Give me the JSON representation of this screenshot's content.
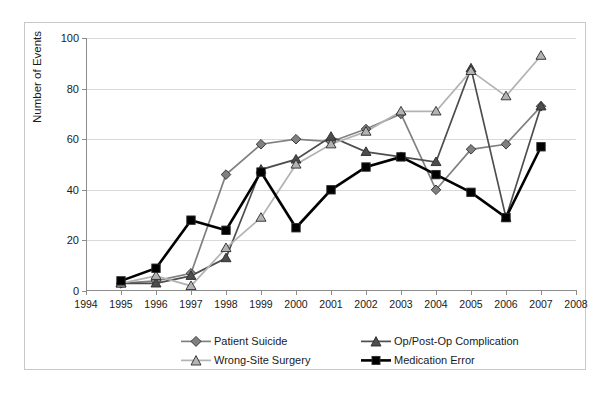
{
  "chart_data": {
    "type": "line",
    "title": "",
    "xlabel": "",
    "ylabel": "Number of Events",
    "xlim": [
      1994,
      2008
    ],
    "ylim": [
      0,
      100
    ],
    "ytick_step": 20,
    "yticks": [
      0,
      20,
      40,
      60,
      80,
      100
    ],
    "xticks": [
      1994,
      1995,
      1996,
      1997,
      1998,
      1999,
      2000,
      2001,
      2002,
      2003,
      2004,
      2005,
      2006,
      2007,
      2008
    ],
    "x": [
      1995,
      1996,
      1997,
      1998,
      1999,
      2000,
      2001,
      2002,
      2003,
      2004,
      2005,
      2006,
      2007
    ],
    "grid": "horizontal",
    "legend_position": "bottom",
    "series": [
      {
        "name": "Patient Suicide",
        "color": "#808080",
        "marker": "diamond",
        "values": [
          3,
          4,
          7,
          46,
          58,
          60,
          59,
          64,
          70,
          40,
          56,
          58,
          73
        ]
      },
      {
        "name": "Op/Post-Op Complication",
        "color": "#4d4d4d",
        "marker": "triangle",
        "values": [
          3,
          3,
          6,
          13,
          48,
          52,
          61,
          55,
          53,
          51,
          88,
          29,
          73
        ]
      },
      {
        "name": "Wrong-Site Surgery",
        "color": "#b3b3b3",
        "marker": "triangle",
        "values": [
          3,
          6,
          2,
          17,
          29,
          50,
          58,
          63,
          71,
          71,
          87,
          77,
          93
        ]
      },
      {
        "name": "Medication Error",
        "color": "#000000",
        "marker": "square",
        "values": [
          4,
          9,
          28,
          24,
          47,
          25,
          40,
          49,
          53,
          46,
          39,
          29,
          57
        ]
      }
    ]
  },
  "axis": {
    "y_title": "Number of Events",
    "y_tick_labels": [
      "0",
      "20",
      "40",
      "60",
      "80",
      "100"
    ],
    "x_tick_labels": [
      "1994",
      "1995",
      "1996",
      "1997",
      "1998",
      "1999",
      "2000",
      "2001",
      "2002",
      "2003",
      "2004",
      "2005",
      "2006",
      "2007",
      "2008"
    ]
  },
  "legend": {
    "entries": [
      {
        "label": "Patient Suicide",
        "color": "#808080",
        "marker": "diamond"
      },
      {
        "label": "Wrong-Site Surgery",
        "color": "#b3b3b3",
        "marker": "triangle"
      },
      {
        "label": "Op/Post-Op Complication",
        "color": "#4d4d4d",
        "marker": "triangle"
      },
      {
        "label": "Medication Error",
        "color": "#000000",
        "marker": "square"
      }
    ]
  }
}
